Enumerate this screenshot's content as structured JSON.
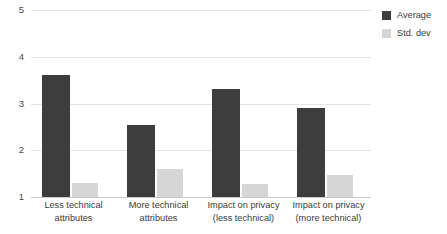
{
  "chart_data": {
    "type": "bar",
    "title": "",
    "xlabel": "",
    "ylabel": "",
    "ylim": [
      1,
      5
    ],
    "yticks": [
      1,
      2,
      3,
      4,
      5
    ],
    "ytick_labels": [
      "1",
      "2",
      "3",
      "4",
      "5"
    ],
    "grid": true,
    "legend_position": "top-right",
    "categories": [
      "Less technical attributes",
      "More technical attributes",
      "Impact on privacy (less technical)",
      "Impact on privacy (more technical)"
    ],
    "category_lines": [
      [
        "Less technical",
        "attributes"
      ],
      [
        "More technical",
        "attributes"
      ],
      [
        "Impact on privacy",
        "(less technical)"
      ],
      [
        "Impact on privacy",
        "(more technical)"
      ]
    ],
    "series": [
      {
        "name": "Average",
        "color": "#3d3d3d",
        "values": [
          3.6,
          2.55,
          3.3,
          2.9
        ]
      },
      {
        "name": "Std. dev",
        "color": "#d6d6d6",
        "values": [
          1.3,
          1.6,
          1.28,
          1.48
        ]
      }
    ]
  },
  "legend": {
    "items": [
      {
        "label": "Average",
        "color": "#3d3d3d",
        "swatch": "legend-swatch-average"
      },
      {
        "label": "Std. dev",
        "color": "#d6d6d6",
        "swatch": "legend-swatch-stddev"
      }
    ]
  },
  "colors": {
    "average": "#3d3d3d",
    "std_dev": "#d6d6d6",
    "gridline": "#e3e3e3",
    "axis": "#c9c9c9",
    "text": "#3a3a3a",
    "background": "#ffffff"
  }
}
